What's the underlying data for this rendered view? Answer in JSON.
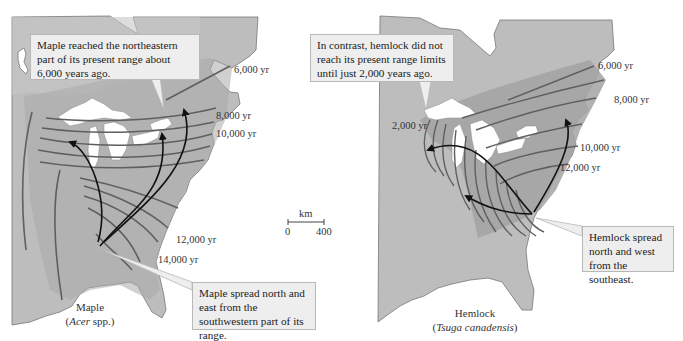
{
  "colors": {
    "land": "#bdbdbd",
    "range_shade": "#a9a9a9",
    "isoline": "#5f5f5f",
    "arrow": "#111111",
    "callout_bg": "#eeeeee",
    "callout_border": "#b8b8b8",
    "water": "#ffffff"
  },
  "maple": {
    "callout_top": "Maple reached the northeastern part of its present range about 6,000 years ago.",
    "callout_bottom": "Maple spread north and east from the southwestern part of its range.",
    "isoline_labels": [
      "6,000 yr",
      "8,000 yr",
      "10,000 yr",
      "12,000 yr",
      "14,000 yr"
    ],
    "title": "Maple",
    "scientific_name": "Acer",
    "scientific_suffix": " spp.)"
  },
  "hemlock": {
    "callout_top": "In contrast, hemlock did not reach its present range limits until just 2,000 years ago.",
    "callout_bottom": "Hemlock spread north and west from the southeast.",
    "isoline_labels": [
      "6,000 yr",
      "8,000 yr",
      "10,000 yr",
      "12,000 yr",
      "2,000 yr"
    ],
    "title": "Hemlock",
    "scientific_name": "Tsuga canadensis"
  },
  "scale_bar": {
    "unit": "km",
    "min": "0",
    "max": "400"
  }
}
